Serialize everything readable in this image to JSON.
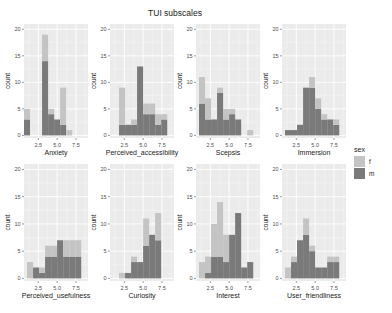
{
  "title": "TUI subscales",
  "legend": {
    "title": "sex",
    "items": [
      {
        "key": "f",
        "label": "f",
        "color": "#c4c4c4"
      },
      {
        "key": "m",
        "label": "m",
        "color": "#7a7a7a"
      }
    ]
  },
  "colors": {
    "panel_bg": "#ebebeb",
    "grid_major": "#ffffff",
    "grid_minor": "#f4f4f4",
    "f": "#c4c4c4",
    "m": "#7a7a7a",
    "axis_text": "#4d4d4d",
    "axis_title": "#1a1a1a"
  },
  "chart_data": {
    "type": "bar",
    "subtype": "stacked histogram, faceted 2x4",
    "title": "TUI subscales",
    "ylabel": "count",
    "ylim": [
      0,
      20
    ],
    "y_ticks": [
      0,
      5,
      10,
      15,
      20
    ],
    "x_ticks": [
      2.5,
      5.0,
      7.5
    ],
    "x_tick_labels": [
      "2.5",
      "5.0",
      "7.5"
    ],
    "xlim": [
      0.6,
      9.1
    ],
    "binwidth": 0.8,
    "legend_position": "right",
    "grid": true,
    "series_names": [
      "m",
      "f"
    ],
    "panels": [
      {
        "name": "Anxiety",
        "bins": [
          1.0,
          1.8,
          2.6,
          3.4,
          4.2,
          5.0,
          5.8,
          6.6,
          7.4,
          8.2
        ],
        "m": [
          3,
          0,
          0,
          14,
          4,
          3,
          2,
          0,
          0,
          0
        ],
        "f": [
          2,
          0,
          0,
          5,
          1,
          0,
          7,
          1,
          0,
          0
        ]
      },
      {
        "name": "Perceived_accessibility",
        "bins": [
          2.2,
          3.0,
          3.8,
          4.6,
          5.4,
          6.2,
          7.0,
          7.8
        ],
        "m": [
          2,
          2,
          2,
          13,
          4,
          4,
          2,
          3
        ],
        "f": [
          7,
          0,
          1,
          0,
          2,
          2,
          2,
          1
        ]
      },
      {
        "name": "Scepsis",
        "bins": [
          1.4,
          2.2,
          3.0,
          3.8,
          4.6,
          5.4,
          6.2,
          7.0,
          7.8
        ],
        "m": [
          6,
          3,
          3,
          8,
          3,
          4,
          3,
          0,
          0
        ],
        "f": [
          5,
          4,
          0,
          1,
          2,
          1,
          0,
          0,
          1
        ],
        "note": "bin at 8.6 has f=1; represented at index 8 shifted"
      },
      {
        "name": "Immersion",
        "bins": [
          1.4,
          2.2,
          3.0,
          3.8,
          4.6,
          5.4,
          6.2,
          7.0,
          7.8
        ],
        "m": [
          1,
          1,
          2,
          9,
          9,
          5,
          3,
          3,
          2
        ],
        "f": [
          0,
          0,
          0,
          0,
          2,
          2,
          1,
          0,
          1
        ]
      },
      {
        "name": "Perceived_usefulness",
        "bins": [
          1.4,
          2.2,
          3.0,
          3.8,
          4.6,
          5.4,
          6.2,
          7.0,
          7.8
        ],
        "m": [
          0,
          2,
          1,
          4,
          4,
          7,
          4,
          4,
          4
        ],
        "f": [
          3,
          0,
          1,
          2,
          2,
          0,
          3,
          3,
          3
        ]
      },
      {
        "name": "Curiosity",
        "bins": [
          2.2,
          3.0,
          3.8,
          4.6,
          5.4,
          6.2,
          7.0,
          7.8
        ],
        "m": [
          0,
          1,
          3,
          3,
          6,
          8,
          7,
          0
        ],
        "f": [
          1,
          0,
          1,
          0,
          5,
          0,
          5,
          0
        ]
      },
      {
        "name": "Interest",
        "bins": [
          1.4,
          2.2,
          3.0,
          3.8,
          4.6,
          5.4,
          6.2,
          7.0,
          7.8
        ],
        "m": [
          0,
          1,
          4,
          4,
          3,
          8,
          12,
          2,
          3
        ],
        "f": [
          3,
          3,
          6,
          10,
          5,
          0,
          0,
          0,
          0
        ]
      },
      {
        "name": "User_friendliness",
        "bins": [
          1.4,
          2.2,
          3.0,
          3.8,
          4.6,
          5.4,
          6.2,
          7.0,
          7.8
        ],
        "m": [
          0,
          3,
          7,
          8,
          5,
          2,
          2,
          3,
          3
        ],
        "f": [
          2,
          1,
          0,
          3,
          1,
          0,
          0,
          1,
          1
        ]
      }
    ]
  }
}
